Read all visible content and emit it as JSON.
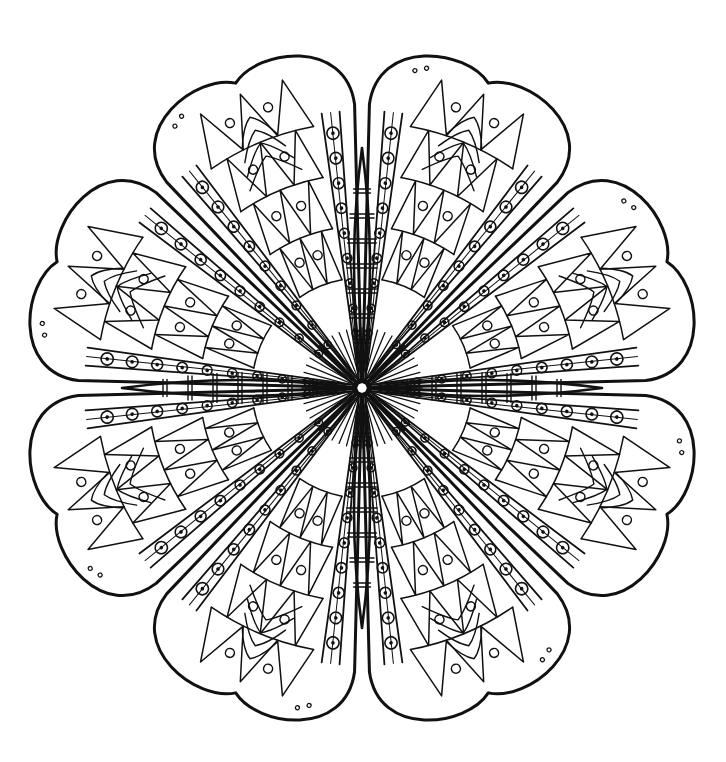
{
  "image": {
    "description": "Black and white coloring-page mandala: eight rounded petals with triangle and chevron patterns, separated by dotted radial bands, with banded spindles on the four axes and a small octagon at the center",
    "background": "#ffffff",
    "ink": "#111111"
  },
  "mandala": {
    "center": [
      362,
      388
    ],
    "petal_count": 8,
    "petal_outer_radius": 330,
    "petal_half_angle_deg": 21,
    "petal_rotation_deg": 22.5,
    "band_dot_count": 9,
    "spindle_count": 4,
    "spindle_length": 240,
    "spindle_stripes": 7,
    "center_octagon_radius": 9
  }
}
